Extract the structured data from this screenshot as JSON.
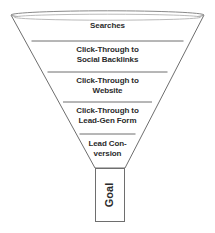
{
  "diagram": {
    "type": "funnel",
    "title": "",
    "background_color": "#ffffff",
    "stroke_color": "#6e6e6e",
    "fill_color": "#ffffff",
    "text_color": "#2b2b2b",
    "stages": [
      {
        "label": "Searches",
        "order": 1
      },
      {
        "label": "Click-Through to\nSocial Backlinks",
        "order": 2
      },
      {
        "label": "Click-Through to\nWebsite",
        "order": 3
      },
      {
        "label": "Click-Through to\nLead-Gen Form",
        "order": 4
      },
      {
        "label": "Lead Con-\nversion",
        "order": 5
      }
    ],
    "neck": {
      "label": "Goal",
      "orientation": "vertical-bottom-to-top"
    }
  }
}
